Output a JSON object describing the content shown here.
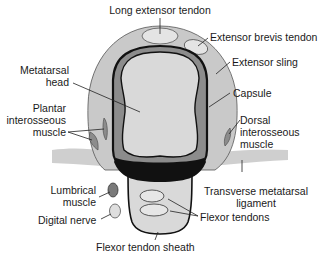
{
  "diagram": {
    "type": "anatomical cross-section",
    "colors": {
      "sling": "#c9c9c9",
      "head": "#d9d9d9",
      "dark_band": "#8c8c8c",
      "ligament": "#cfcfcf",
      "outline": "#111111",
      "lumbrical": "#7a7a7a",
      "nerve": "#dedede",
      "tendon_light": "#e6e6e6"
    }
  },
  "labels": {
    "long_extensor_tendon": "Long extensor tendon",
    "extensor_brevis_tendon": "Extensor brevis tendon",
    "extensor_sling": "Extensor sling",
    "capsule": "Capsule",
    "metatarsal_head_1": "Metatarsal",
    "metatarsal_head_2": "head",
    "plantar_interosseous_1": "Plantar",
    "plantar_interosseous_2": "interosseous",
    "plantar_interosseous_3": "muscle",
    "dorsal_interosseous_1": "Dorsal",
    "dorsal_interosseous_2": "interosseous",
    "dorsal_interosseous_3": "muscle",
    "transverse_ligament_1": "Transverse metatarsal",
    "transverse_ligament_2": "ligament",
    "lumbrical_1": "Lumbrical",
    "lumbrical_2": "muscle",
    "digital_nerve": "Digital nerve",
    "flexor_tendons": "Flexor tendons",
    "flexor_tendon_sheath": "Flexor tendon sheath"
  }
}
